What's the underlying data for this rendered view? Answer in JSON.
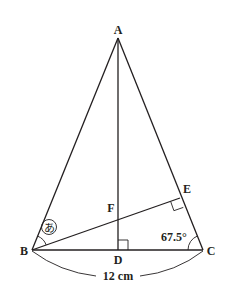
{
  "figure": {
    "points": {
      "A": {
        "label": "A",
        "x": 118,
        "y": 38
      },
      "B": {
        "label": "B",
        "x": 32,
        "y": 250
      },
      "C": {
        "label": "C",
        "x": 203,
        "y": 250
      },
      "D": {
        "label": "D",
        "x": 118,
        "y": 250
      },
      "E": {
        "label": "E",
        "x": 180,
        "y": 198
      },
      "F": {
        "label": "F",
        "x": 118,
        "y": 216
      }
    },
    "segments": [
      "AB",
      "AC",
      "BC",
      "AD",
      "BE"
    ],
    "right_angles": [
      "ADB",
      "BEC"
    ],
    "angle_marks": {
      "unknown": {
        "vertex": "B",
        "label": "あ"
      },
      "given": {
        "vertex": "C",
        "label": "67.5°"
      }
    },
    "dimension": {
      "between": "BC",
      "label": "12 cm"
    }
  }
}
